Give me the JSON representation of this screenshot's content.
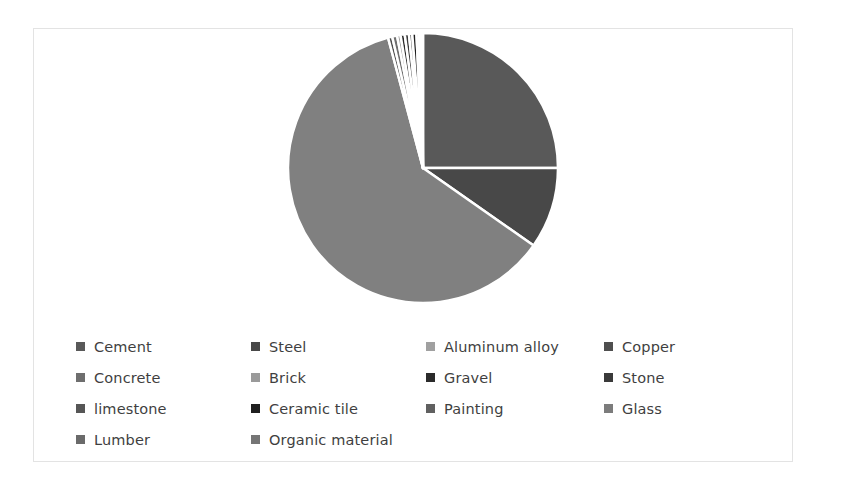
{
  "chart_data": {
    "type": "pie",
    "title": "",
    "legend_position": "bottom",
    "grid": false,
    "start_angle_deg": 0,
    "direction": "clockwise",
    "categories": [
      "Cement",
      "Steel",
      "Aluminum alloy",
      "Copper",
      "Concrete",
      "Brick",
      "Gravel",
      "Stone",
      "limestone",
      "Ceramic tile",
      "Painting",
      "Glass",
      "Lumber",
      "Organic material"
    ],
    "values": [
      25.0,
      9.7,
      61.1,
      0.5,
      0.6,
      0.4,
      0.5,
      0.5,
      0.4,
      0.5,
      0.3,
      0.2,
      0.2,
      0.1
    ],
    "unit": "percent",
    "slices": [
      {
        "label": "Cement",
        "value": 25.0,
        "color": "#595959",
        "start_deg": 0.0,
        "end_deg": 90.0
      },
      {
        "label": "Steel",
        "value": 9.7,
        "color": "#484848",
        "start_deg": 90.0,
        "end_deg": 125.0
      },
      {
        "label": "Aluminum alloy",
        "value": 61.1,
        "color": "#808080",
        "start_deg": 125.0,
        "end_deg": 345.0
      },
      {
        "label": "Copper",
        "value": 0.5,
        "color": "#4f4f4f",
        "start_deg": 345.0,
        "end_deg": 346.8
      },
      {
        "label": "Concrete",
        "value": 0.6,
        "color": "#6e6e6e",
        "start_deg": 346.8,
        "end_deg": 348.9
      },
      {
        "label": "Brick",
        "value": 0.4,
        "color": "#9a9a9a",
        "start_deg": 348.9,
        "end_deg": 350.4
      },
      {
        "label": "Gravel",
        "value": 0.5,
        "color": "#2b2b2b",
        "start_deg": 350.4,
        "end_deg": 352.2
      },
      {
        "label": "Stone",
        "value": 0.5,
        "color": "#3a3a3a",
        "start_deg": 352.2,
        "end_deg": 354.0
      },
      {
        "label": "limestone",
        "value": 0.4,
        "color": "#565656",
        "start_deg": 354.0,
        "end_deg": 355.4
      },
      {
        "label": "Ceramic tile",
        "value": 0.5,
        "color": "#1f1f1f",
        "start_deg": 355.4,
        "end_deg": 357.2
      },
      {
        "label": "Painting",
        "value": 0.3,
        "color": "#606060",
        "start_deg": 357.2,
        "end_deg": 358.3
      },
      {
        "label": "Glass",
        "value": 0.2,
        "color": "#7c7c7c",
        "start_deg": 358.3,
        "end_deg": 359.0
      },
      {
        "label": "Lumber",
        "value": 0.2,
        "color": "#6a6a6a",
        "start_deg": 359.0,
        "end_deg": 359.6
      },
      {
        "label": "Organic material",
        "value": 0.1,
        "color": "#757575",
        "start_deg": 359.6,
        "end_deg": 360.0
      }
    ],
    "geometry": {
      "center_x": 389,
      "center_y": 139,
      "radius": 135,
      "separator_color": "#ffffff",
      "separator_width": 2.5
    }
  },
  "legend": {
    "rows": [
      [
        {
          "label": "Cement",
          "color": "#595959"
        },
        {
          "label": "Steel",
          "color": "#484848"
        },
        {
          "label": "Aluminum alloy",
          "color": "#a0a0a0"
        },
        {
          "label": "Copper",
          "color": "#4f4f4f"
        }
      ],
      [
        {
          "label": "Concrete",
          "color": "#6e6e6e"
        },
        {
          "label": "Brick",
          "color": "#9a9a9a"
        },
        {
          "label": "Gravel",
          "color": "#2b2b2b"
        },
        {
          "label": "Stone",
          "color": "#3a3a3a"
        }
      ],
      [
        {
          "label": "limestone",
          "color": "#565656"
        },
        {
          "label": "Ceramic tile",
          "color": "#1f1f1f"
        },
        {
          "label": "Painting",
          "color": "#606060"
        },
        {
          "label": "Glass",
          "color": "#7c7c7c"
        }
      ],
      [
        {
          "label": "Lumber",
          "color": "#6a6a6a"
        },
        {
          "label": "Organic material",
          "color": "#757575"
        }
      ]
    ]
  },
  "style": {
    "frame_border_color": "#e3e3e3",
    "background": "#ffffff",
    "text_color": "#3f3f3f"
  }
}
